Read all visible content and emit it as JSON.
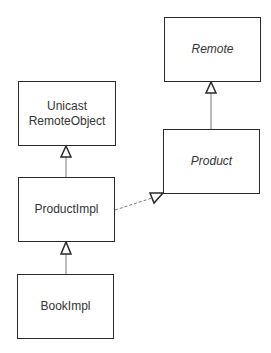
{
  "diagram": {
    "type": "uml-class",
    "classes": {
      "remote": {
        "label": "Remote",
        "abstract": true
      },
      "unicast": {
        "line1": "Unicast",
        "line2": "RemoteObject",
        "abstract": false
      },
      "product": {
        "label": "Product",
        "abstract": true
      },
      "product_impl": {
        "label": "ProductImpl",
        "abstract": false
      },
      "book_impl": {
        "label": "BookImpl",
        "abstract": false
      }
    },
    "relations": [
      {
        "from": "Product",
        "to": "Remote",
        "kind": "generalization"
      },
      {
        "from": "ProductImpl",
        "to": "UnicastRemoteObject",
        "kind": "generalization"
      },
      {
        "from": "BookImpl",
        "to": "ProductImpl",
        "kind": "generalization"
      },
      {
        "from": "ProductImpl",
        "to": "Product",
        "kind": "realization"
      }
    ],
    "colors": {
      "line": "#2a2a2a",
      "text": "#333333",
      "edge": "#777777"
    }
  }
}
